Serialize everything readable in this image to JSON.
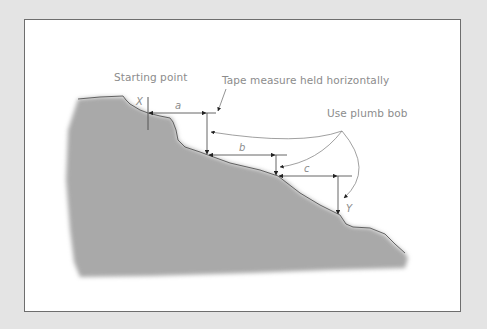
{
  "diagram": {
    "labels": {
      "starting_point": "Starting point",
      "tape_measure": "Tape measure held horizontally",
      "plumb_bob": "Use plumb bob"
    },
    "points": {
      "start": "X",
      "end": "Y"
    },
    "segments": [
      {
        "id": "a",
        "label": "a"
      },
      {
        "id": "b",
        "label": "b"
      },
      {
        "id": "c",
        "label": "c"
      }
    ],
    "colors": {
      "background": "#e4e4e4",
      "panel": "#ffffff",
      "ground": "#a9a9a9",
      "line": "#555555",
      "text": "#8c8c8c"
    }
  }
}
